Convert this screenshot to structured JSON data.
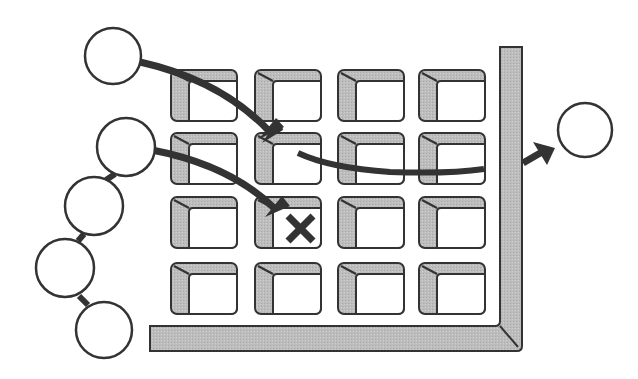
{
  "diagram": {
    "title": "",
    "colors": {
      "outline": "#333333",
      "fill_gray": "#b8b8b8",
      "fill_white": "#ffffff",
      "arrow": "#333333"
    },
    "pores": {
      "columns_x": [
        171,
        255,
        338,
        419
      ],
      "rows_y": [
        70,
        133,
        197,
        263
      ],
      "width": 66,
      "height": 51
    },
    "wall": {
      "vertical": {
        "x": 500,
        "y_top": 47,
        "width": 22
      },
      "horizontal": {
        "y": 326,
        "x_left": 150,
        "height": 25
      }
    },
    "particles": [
      {
        "id": "incoming-1",
        "cx": 113,
        "cy": 56,
        "r": 28
      },
      {
        "id": "chain-1",
        "cx": 126,
        "cy": 147,
        "r": 29
      },
      {
        "id": "chain-2",
        "cx": 94,
        "cy": 206,
        "r": 29
      },
      {
        "id": "chain-3",
        "cx": 65,
        "cy": 268,
        "r": 29
      },
      {
        "id": "chain-4",
        "cx": 104,
        "cy": 330,
        "r": 28
      },
      {
        "id": "outgoing",
        "cx": 585,
        "cy": 130,
        "r": 27
      }
    ],
    "blocked_marker": {
      "symbol": "x",
      "cx": 300,
      "cy": 229
    }
  }
}
